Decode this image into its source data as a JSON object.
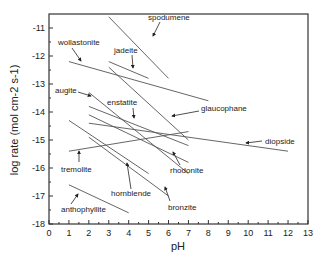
{
  "chart_data": {
    "type": "line",
    "title": "",
    "xlabel": "pH",
    "ylabel": "log rate (mol cm-2 s-1)",
    "xlim": [
      0,
      13
    ],
    "ylim": [
      -18,
      -10.5
    ],
    "xticks": [
      0,
      1,
      2,
      3,
      4,
      5,
      6,
      7,
      8,
      9,
      10,
      11,
      12,
      13
    ],
    "yticks": [
      -11,
      -12,
      -13,
      -14,
      -15,
      -16,
      -17,
      -18
    ],
    "grid": false,
    "legend": "inline annotations with arrows",
    "series": [
      {
        "name": "spodumene",
        "x": [
          3.0,
          6.0
        ],
        "y": [
          -10.6,
          -12.8
        ]
      },
      {
        "name": "jadeite",
        "x": [
          3.0,
          5.0
        ],
        "y": [
          -12.2,
          -12.8
        ]
      },
      {
        "name": "wollastonite",
        "x": [
          1.0,
          8.0
        ],
        "y": [
          -12.2,
          -13.6
        ]
      },
      {
        "name": "glaucophane",
        "x": [
          3.0,
          7.0
        ],
        "y": [
          -12.4,
          -15.0
        ]
      },
      {
        "name": "augite",
        "x": [
          2.0,
          7.0
        ],
        "y": [
          -13.3,
          -16.2
        ]
      },
      {
        "name": "enstatite",
        "x": [
          2.0,
          7.0
        ],
        "y": [
          -13.8,
          -15.2
        ]
      },
      {
        "name": "rhodonite",
        "x": [
          2.0,
          7.0
        ],
        "y": [
          -14.1,
          -15.8
        ]
      },
      {
        "name": "diopside",
        "x": [
          2.0,
          12.0
        ],
        "y": [
          -14.4,
          -15.4
        ]
      },
      {
        "name": "tremolite",
        "x": [
          1.0,
          7.0
        ],
        "y": [
          -15.4,
          -14.7
        ]
      },
      {
        "name": "hornblende",
        "x": [
          1.0,
          5.0
        ],
        "y": [
          -14.3,
          -16.2
        ]
      },
      {
        "name": "bronzite",
        "x": [
          2.0,
          6.0
        ],
        "y": [
          -14.9,
          -17.0
        ]
      },
      {
        "name": "anthophyllite",
        "x": [
          1.0,
          4.0
        ],
        "y": [
          -16.6,
          -17.6
        ]
      }
    ]
  },
  "labels": {
    "spodumene": "spodumene",
    "jadeite": "jadeite",
    "wollastonite": "wollastonite",
    "glaucophane": "glaucophane",
    "augite": "augite",
    "enstatite": "enstatite",
    "rhodonite": "rhodonite",
    "diopside": "diopside",
    "tremolite": "tremolite",
    "hornblende": "hornblende",
    "bronzite": "bronzite",
    "anthophyllite": "anthophyllite"
  },
  "axes": {
    "xlabel": "pH",
    "ylabel": "log rate (mol cm-2 s-1)",
    "xticks": [
      "0",
      "1",
      "2",
      "3",
      "4",
      "5",
      "6",
      "7",
      "8",
      "9",
      "10",
      "11",
      "12",
      "13"
    ],
    "yticks": [
      "-11",
      "-12",
      "-13",
      "-14",
      "-15",
      "-16",
      "-17",
      "-18"
    ]
  }
}
